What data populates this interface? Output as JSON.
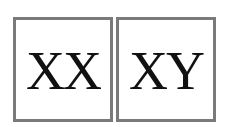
{
  "boxes": [
    {
      "label": "XX"
    },
    {
      "label": "XY"
    }
  ],
  "colors": {
    "border": "#7a7a7a",
    "text": "#111111",
    "background": "#ffffff"
  }
}
